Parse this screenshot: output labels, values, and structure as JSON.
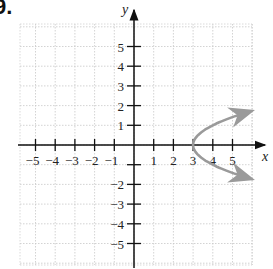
{
  "problem_label": "9.",
  "chart_data": {
    "type": "line",
    "title": "",
    "xlabel": "x",
    "ylabel": "y",
    "xlim": [
      -6,
      6
    ],
    "ylim": [
      -6,
      6
    ],
    "grid": true,
    "x_ticks": [
      -5,
      -4,
      -3,
      -2,
      -1,
      1,
      2,
      3,
      4,
      5
    ],
    "y_ticks": [
      -5,
      -4,
      -3,
      -2,
      -1,
      1,
      2,
      3,
      4,
      5
    ],
    "x_tick_labels": [
      "−5",
      "−4",
      "−3",
      "−2",
      "−1",
      "1",
      "2",
      "3",
      "4",
      "5"
    ],
    "y_tick_labels": [
      "−5",
      "−4",
      "−3",
      "−2",
      "−1",
      "1",
      "2",
      "3",
      "4",
      "5"
    ],
    "series": [
      {
        "name": "parabola opening right (x = y² + 3)",
        "color": "#9a9a9a",
        "vertex": [
          3,
          0
        ],
        "arrows_at_ends": true,
        "points": [
          [
            5.9,
            1.7
          ],
          [
            5,
            1.41
          ],
          [
            4,
            1
          ],
          [
            3.5,
            0.71
          ],
          [
            3,
            0
          ],
          [
            3.5,
            -0.71
          ],
          [
            4,
            -1
          ],
          [
            5,
            -1.41
          ],
          [
            5.9,
            -1.7
          ]
        ]
      }
    ]
  }
}
